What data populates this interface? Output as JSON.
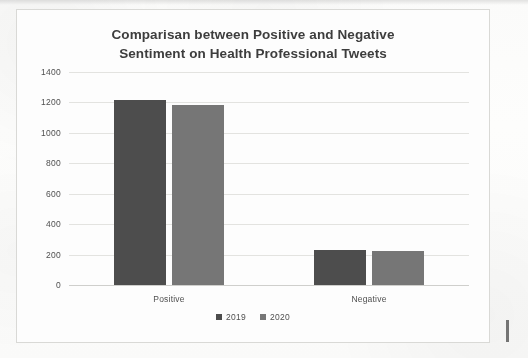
{
  "document": {
    "kind": "scanned-chart-figure",
    "page_background": "#fbfbfa",
    "frame_border_color": "#d9d9d6"
  },
  "chart_data": {
    "type": "bar",
    "title": "Comparisan between Positive and Negative Sentiment on Health Professional Tweets",
    "title_line_1": "Comparisan between Positive and Negative",
    "title_line_2": "Sentiment on Health Professional Tweets",
    "xlabel": "",
    "ylabel": "",
    "categories": [
      "Positive",
      "Negative"
    ],
    "series": [
      {
        "name": "2019",
        "color": "#4d4d4d",
        "values": [
          1215,
          230
        ]
      },
      {
        "name": "2020",
        "color": "#767676",
        "values": [
          1185,
          225
        ]
      }
    ],
    "ylim": [
      0,
      1400
    ],
    "ytick_step": 200,
    "yticks": [
      "1400",
      "1200",
      "1000",
      "800",
      "600",
      "400",
      "200",
      "0"
    ],
    "ytick_values": [
      1400,
      1200,
      1000,
      800,
      600,
      400,
      200,
      0
    ],
    "grid": true,
    "grid_axis": "y",
    "grid_color": "#e3e3e0",
    "legend": [
      "2019",
      "2020"
    ],
    "legend_position": "bottom",
    "data_labels": false
  }
}
